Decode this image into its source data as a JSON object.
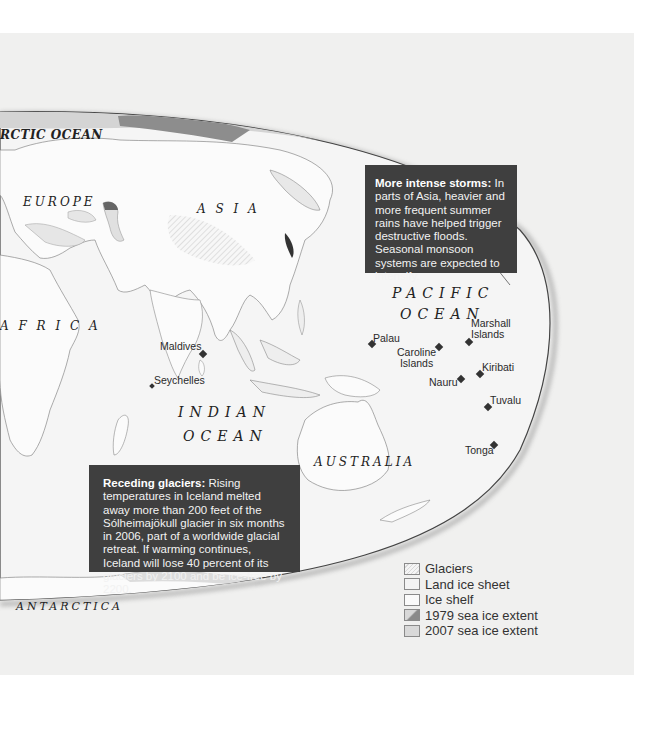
{
  "map": {
    "regions": {
      "arctic_ocean": "RCTIC OCEAN",
      "europe": "EUROPE",
      "asia": "A S I A",
      "africa": "A F R I C A",
      "australia": "AUSTRALIA",
      "antarctica": "ANTARCTICA"
    },
    "oceans": {
      "pacific_line1": "PACIFIC",
      "pacific_line2": "OCEAN",
      "indian_line1": "INDIAN",
      "indian_line2": "OCEAN"
    },
    "islands": [
      {
        "name": "Maldives"
      },
      {
        "name": "Seychelles"
      },
      {
        "name": "Palau"
      },
      {
        "name": "Caroline Islands",
        "line1": "Caroline",
        "line2": "Islands"
      },
      {
        "name": "Marshall Islands",
        "line1": "Marshall",
        "line2": "Islands"
      },
      {
        "name": "Kiribati"
      },
      {
        "name": "Nauru"
      },
      {
        "name": "Tuvalu"
      },
      {
        "name": "Tonga"
      }
    ],
    "callouts": {
      "storms": {
        "title": "More intense storms:",
        "body": "In parts of Asia, heavier and more frequent summer rains have helped trigger destructive floods. Seasonal monsoon systems are expected to intensify."
      },
      "glaciers": {
        "title": "Receding glaciers:",
        "body": "Rising temperatures in Iceland melted away more than 200 feet of the Sólheimajökull glacier in six months in 2006, part of a worldwide glacial retreat. If warming continues, Iceland will lose 40 percent of its glaciers by 2100 and be ice-free by 2200."
      }
    },
    "legend": [
      {
        "label": "Glaciers",
        "swatch": "hatched-light"
      },
      {
        "label": "Land ice sheet",
        "swatch": "light-gray"
      },
      {
        "label": "Ice shelf",
        "swatch": "white"
      },
      {
        "label": "1979 sea ice extent",
        "swatch": "dark-gray-diagonal"
      },
      {
        "label": "2007 sea ice extent",
        "swatch": "medium-gray"
      }
    ],
    "colors": {
      "background": "#f0f0ef",
      "globe": "#f7f7f7",
      "callout_bg": "#3f3f3f",
      "sea_ice_2007": "#d9d9d9",
      "sea_ice_1979": "#8a8a8a"
    }
  }
}
